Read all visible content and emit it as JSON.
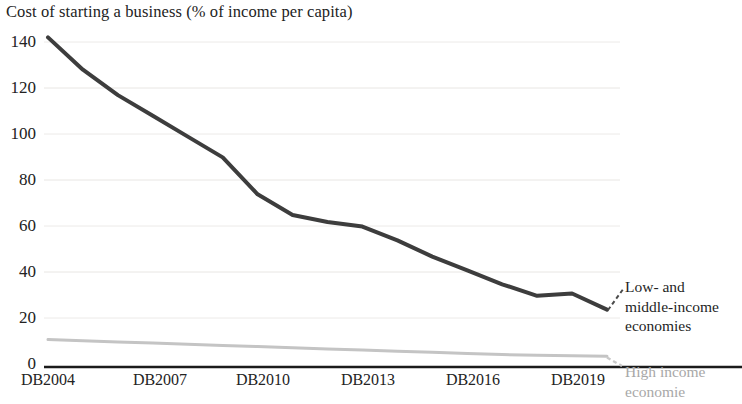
{
  "chart_data": {
    "type": "line",
    "title": "Cost of starting a business (% of income per capita)",
    "xlabel": "",
    "ylabel": "",
    "ylim": [
      0,
      140
    ],
    "yticks": [
      0,
      20,
      40,
      60,
      80,
      100,
      120,
      140
    ],
    "xticks": [
      "DB2004",
      "DB2007",
      "DB2010",
      "DB2013",
      "DB2016",
      "DB2019"
    ],
    "x": [
      "DB2004",
      "DB2005",
      "DB2006",
      "DB2007",
      "DB2008",
      "DB2009",
      "DB2010",
      "DB2011",
      "DB2012",
      "DB2013",
      "DB2014",
      "DB2015",
      "DB2016",
      "DB2017",
      "DB2018",
      "DB2019",
      "DB2020"
    ],
    "grid": true,
    "legend_position": "right",
    "series": [
      {
        "name": "Low- and middle-income economies",
        "color": "#3d3d3d",
        "values": [
          142,
          128,
          117,
          108,
          99,
          90,
          74,
          65,
          62,
          60,
          54,
          47,
          41,
          35,
          30,
          31,
          24
        ]
      },
      {
        "name": "High income economies",
        "color": "#c4c4c4",
        "values": [
          11,
          10.5,
          10,
          9.5,
          9,
          8.5,
          8,
          7.5,
          7,
          6.5,
          6,
          5.5,
          5,
          4.5,
          4.2,
          4,
          3.8
        ]
      }
    ]
  },
  "axes": {
    "y_tick_labels": [
      "140",
      "120",
      "100",
      "80",
      "60",
      "40",
      "20",
      "0"
    ],
    "x_tick_labels": [
      "DB2004",
      "DB2007",
      "DB2010",
      "DB2013",
      "DB2016",
      "DB2019"
    ]
  },
  "legend": {
    "low_middle": "Low- and\nmiddle-income\neconomies",
    "low_middle_lines": [
      "Low- and",
      "middle-income",
      "economies"
    ],
    "high_income_lines": [
      "High income",
      "economie"
    ]
  }
}
